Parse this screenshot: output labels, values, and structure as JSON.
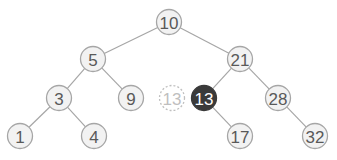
{
  "diagram": {
    "type": "binary-search-tree",
    "radius": 12.5,
    "nodes": [
      {
        "id": "n10",
        "label": "10",
        "x": 169,
        "y": 22,
        "style": "normal"
      },
      {
        "id": "n5",
        "label": "5",
        "x": 93,
        "y": 59,
        "style": "normal"
      },
      {
        "id": "n21",
        "label": "21",
        "x": 240,
        "y": 59,
        "style": "normal"
      },
      {
        "id": "n3",
        "label": "3",
        "x": 59,
        "y": 98,
        "style": "normal"
      },
      {
        "id": "n9",
        "label": "9",
        "x": 131,
        "y": 98,
        "style": "normal"
      },
      {
        "id": "n13ghost",
        "label": "13",
        "x": 172,
        "y": 98,
        "style": "ghost"
      },
      {
        "id": "n13",
        "label": "13",
        "x": 204,
        "y": 98,
        "style": "highlight"
      },
      {
        "id": "n28",
        "label": "28",
        "x": 278,
        "y": 98,
        "style": "normal"
      },
      {
        "id": "n1",
        "label": "1",
        "x": 20,
        "y": 136,
        "style": "normal"
      },
      {
        "id": "n4",
        "label": "4",
        "x": 94,
        "y": 136,
        "style": "normal"
      },
      {
        "id": "n17",
        "label": "17",
        "x": 240,
        "y": 136,
        "style": "normal"
      },
      {
        "id": "n32",
        "label": "32",
        "x": 315,
        "y": 136,
        "style": "normal"
      }
    ],
    "edges": [
      [
        "n10",
        "n5"
      ],
      [
        "n10",
        "n21"
      ],
      [
        "n5",
        "n3"
      ],
      [
        "n5",
        "n9"
      ],
      [
        "n21",
        "n13"
      ],
      [
        "n21",
        "n28"
      ],
      [
        "n3",
        "n1"
      ],
      [
        "n3",
        "n4"
      ],
      [
        "n13",
        "n17"
      ],
      [
        "n28",
        "n32"
      ]
    ],
    "colors": {
      "edge": "#a6a6a6",
      "node_fill": "#f2f2f2",
      "node_text": "#595959",
      "highlight_fill": "#3a3a3a",
      "ghost_stroke": "#bfbfbf"
    }
  }
}
